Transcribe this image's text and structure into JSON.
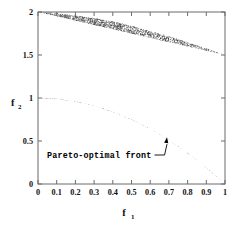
{
  "chart_data": {
    "type": "scatter",
    "title": "",
    "subtitle": "",
    "xlabel": "f_1",
    "ylabel": "f_2",
    "xlabel_base": "f",
    "xlabel_sub": "1",
    "ylabel_base": "f",
    "ylabel_sub": "2",
    "xlim": [
      0,
      1
    ],
    "ylim": [
      0,
      2
    ],
    "grid": false,
    "legend": "none",
    "xticks": [
      0,
      0.1,
      0.2,
      0.3,
      0.4,
      0.5,
      0.6,
      0.7,
      0.8,
      0.9,
      1
    ],
    "xticklabels": [
      "0",
      "0.1",
      "0.2",
      "0.3",
      "0.4",
      "0.5",
      "0.6",
      "0.7",
      "0.8",
      "0.9",
      "1"
    ],
    "yticks": [
      0,
      0.5,
      1,
      1.5,
      2
    ],
    "yticklabels": [
      "0",
      "0.5",
      "1",
      "1.5",
      "2"
    ],
    "point_count": 20000,
    "point_color": "#303030",
    "region_description": "Dense random point cloud filling the feasible objective space between a lower boundary (Pareto-optimal front) and an upper boundary curve.",
    "boundaries": {
      "lower_curve_name": "Pareto-optimal front",
      "lower_curve_points": [
        {
          "x": 0.0,
          "y": 1.0
        },
        {
          "x": 0.1,
          "y": 0.99
        },
        {
          "x": 0.2,
          "y": 0.96
        },
        {
          "x": 0.3,
          "y": 0.91
        },
        {
          "x": 0.4,
          "y": 0.84
        },
        {
          "x": 0.5,
          "y": 0.75
        },
        {
          "x": 0.6,
          "y": 0.64
        },
        {
          "x": 0.7,
          "y": 0.51
        },
        {
          "x": 0.8,
          "y": 0.36
        },
        {
          "x": 0.9,
          "y": 0.19
        },
        {
          "x": 1.0,
          "y": 0.0
        }
      ],
      "upper_curve_points": [
        {
          "x": 0.0,
          "y": 2.0
        },
        {
          "x": 0.1,
          "y": 1.99
        },
        {
          "x": 0.2,
          "y": 1.96
        },
        {
          "x": 0.3,
          "y": 1.93
        },
        {
          "x": 0.4,
          "y": 1.89
        },
        {
          "x": 0.5,
          "y": 1.84
        },
        {
          "x": 0.6,
          "y": 1.78
        },
        {
          "x": 0.7,
          "y": 1.72
        },
        {
          "x": 0.8,
          "y": 1.65
        },
        {
          "x": 0.9,
          "y": 1.58
        },
        {
          "x": 1.0,
          "y": 1.5
        }
      ]
    },
    "annotations": [
      {
        "text": "Pareto-optimal front",
        "x": 0.06,
        "y": 0.42,
        "leader_to_x": 0.69,
        "leader_to_y": 0.545
      }
    ]
  },
  "axes": {
    "frame_color": "#6b6b6b",
    "tick_direction": "in"
  }
}
